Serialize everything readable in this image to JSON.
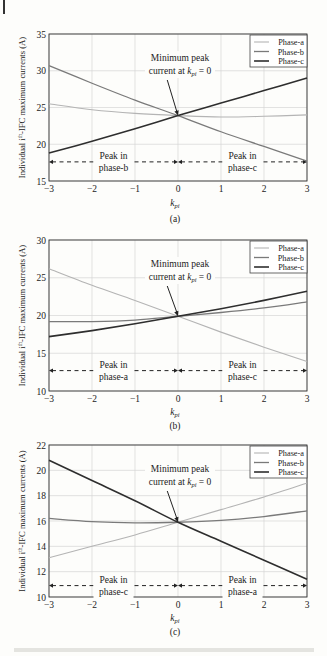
{
  "figure": {
    "caption_text_visible": false,
    "panels_count": 3
  },
  "chart_data": [
    {
      "type": "line",
      "panel_label": "(a)",
      "title": "",
      "xlabel": "k_pi",
      "ylabel": "Individual i^th-IFC maximum currents (A)",
      "xlim": [
        -3,
        3
      ],
      "ylim": [
        15,
        35
      ],
      "xticks": [
        -3,
        -2,
        -1,
        0,
        1,
        2,
        3
      ],
      "yticks": [
        15,
        20,
        25,
        30,
        35
      ],
      "grid": true,
      "legend_position": "upper right",
      "x": [
        -3,
        -2,
        -1,
        0,
        1,
        2,
        3
      ],
      "series": [
        {
          "name": "Phase-a",
          "color": "#b4b4b4",
          "width": 1.1,
          "values": [
            25.5,
            24.7,
            24.2,
            23.9,
            23.7,
            23.8,
            24.0
          ]
        },
        {
          "name": "Phase-b",
          "color": "#7a7a7a",
          "width": 1.3,
          "values": [
            30.7,
            28.3,
            26.0,
            23.9,
            21.7,
            19.7,
            17.7
          ]
        },
        {
          "name": "Phase-c",
          "color": "#2e2e2e",
          "width": 1.6,
          "values": [
            18.8,
            20.4,
            22.1,
            23.9,
            25.6,
            27.3,
            29.0
          ]
        }
      ],
      "annotation": {
        "text_line1": "Minimum peak",
        "text_line2": "current at k_pi = 0",
        "arrow_to": [
          0,
          23.9
        ]
      },
      "regions": [
        {
          "label_line1": "Peak in",
          "label_line2": "phase-b",
          "x_from": -3,
          "x_to": 0,
          "y": 17.6
        },
        {
          "label_line1": "Peak in",
          "label_line2": "phase-c",
          "x_from": 0,
          "x_to": 3,
          "y": 17.6
        }
      ]
    },
    {
      "type": "line",
      "panel_label": "(b)",
      "title": "",
      "xlabel": "k_pi",
      "ylabel": "Individual i^th-IFC maximum currents (A)",
      "xlim": [
        -3,
        3
      ],
      "ylim": [
        10,
        30
      ],
      "xticks": [
        -3,
        -2,
        -1,
        0,
        1,
        2,
        3
      ],
      "yticks": [
        10,
        15,
        20,
        25,
        30
      ],
      "grid": true,
      "legend_position": "upper right",
      "x": [
        -3,
        -2,
        -1,
        0,
        1,
        2,
        3
      ],
      "series": [
        {
          "name": "Phase-a",
          "color": "#b4b4b4",
          "width": 1.1,
          "values": [
            26.2,
            24.0,
            22.0,
            19.9,
            17.8,
            15.8,
            13.9
          ]
        },
        {
          "name": "Phase-b",
          "color": "#7a7a7a",
          "width": 1.3,
          "values": [
            19.2,
            19.2,
            19.4,
            19.9,
            20.4,
            21.0,
            21.8
          ]
        },
        {
          "name": "Phase-c",
          "color": "#2e2e2e",
          "width": 1.6,
          "values": [
            17.2,
            18.0,
            18.9,
            19.9,
            20.9,
            22.0,
            23.2
          ]
        }
      ],
      "annotation": {
        "text_line1": "Minimum peak",
        "text_line2": "current at k_pi = 0",
        "arrow_to": [
          0,
          19.9
        ]
      },
      "regions": [
        {
          "label_line1": "Peak in",
          "label_line2": "phase-a",
          "x_from": -3,
          "x_to": 0,
          "y": 12.7
        },
        {
          "label_line1": "Peak in",
          "label_line2": "phase-c",
          "x_from": 0,
          "x_to": 3,
          "y": 12.7
        }
      ]
    },
    {
      "type": "line",
      "panel_label": "(c)",
      "title": "",
      "xlabel": "k_pi",
      "ylabel": "Individual i^th-IFC maximum currents (A)",
      "xlim": [
        -3,
        3
      ],
      "ylim": [
        10,
        22
      ],
      "xticks": [
        -3,
        -2,
        -1,
        0,
        1,
        2,
        3
      ],
      "yticks": [
        10,
        12,
        14,
        16,
        18,
        20,
        22
      ],
      "grid": true,
      "legend_position": "upper right",
      "x": [
        -3,
        -2,
        -1,
        0,
        1,
        2,
        3
      ],
      "series": [
        {
          "name": "Phase-a",
          "color": "#b4b4b4",
          "width": 1.1,
          "values": [
            13.1,
            14.0,
            14.9,
            15.9,
            16.9,
            17.9,
            19.0
          ]
        },
        {
          "name": "Phase-b",
          "color": "#7a7a7a",
          "width": 1.3,
          "values": [
            16.2,
            15.95,
            15.85,
            15.9,
            16.05,
            16.35,
            16.8
          ]
        },
        {
          "name": "Phase-c",
          "color": "#2e2e2e",
          "width": 1.6,
          "values": [
            20.8,
            19.2,
            17.6,
            15.9,
            14.4,
            12.9,
            11.4
          ]
        }
      ],
      "annotation": {
        "text_line1": "Minimum peak",
        "text_line2": "current at k_pi = 0",
        "arrow_to": [
          0,
          15.9
        ]
      },
      "regions": [
        {
          "label_line1": "Peak in",
          "label_line2": "phase-c",
          "x_from": -3,
          "x_to": 0,
          "y": 10.9
        },
        {
          "label_line1": "Peak in",
          "label_line2": "phase-a",
          "x_from": 0,
          "x_to": 3,
          "y": 10.9
        }
      ]
    }
  ]
}
